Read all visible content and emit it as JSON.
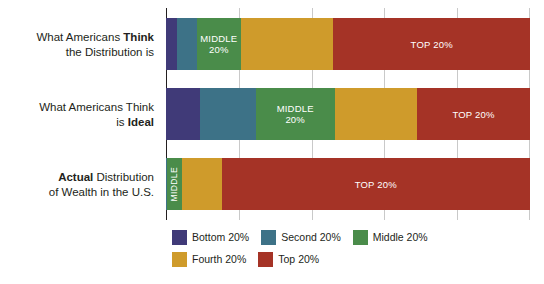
{
  "chart_data": {
    "type": "bar",
    "orientation": "horizontal",
    "stacked": true,
    "percent": true,
    "title": "",
    "subtitle": "",
    "xlabel": "",
    "ylabel": "",
    "xlim": [
      0,
      100
    ],
    "grid": true,
    "gridline_positions": [
      0,
      20,
      40,
      60,
      80,
      100
    ],
    "legend_position": "bottom-left",
    "categories": [
      "What Americans Think the Distribution is",
      "What Americans Think is Ideal",
      "Actual Distribution of Wealth in the U.S."
    ],
    "series": [
      {
        "name": "Bottom 20%",
        "color": "#403a78",
        "values": [
          2.9,
          9.3,
          0.1
        ]
      },
      {
        "name": "Second 20%",
        "color": "#3d7287",
        "values": [
          5.6,
          15.3,
          0.2
        ]
      },
      {
        "name": "Middle 20%",
        "color": "#4a8c4a",
        "values": [
          12.0,
          21.8,
          4.0
        ]
      },
      {
        "name": "Fourth 20%",
        "color": "#cf9b2b",
        "values": [
          25.5,
          22.6,
          11.0
        ]
      },
      {
        "name": "Top 20%",
        "color": "#a53326",
        "values": [
          54.0,
          31.0,
          84.7
        ]
      }
    ],
    "annotations": [
      {
        "bar": 1,
        "segment": "Middle 20%",
        "text": "MIDDLE\n20%"
      },
      {
        "bar": 1,
        "segment": "Top 20%",
        "text": "TOP 20%"
      },
      {
        "bar": 2,
        "segment": "Middle 20%",
        "text": "MIDDLE\n20%"
      },
      {
        "bar": 2,
        "segment": "Top 20%",
        "text": "TOP 20%"
      },
      {
        "bar": 3,
        "segment": "Middle 20%",
        "text": "MIDDLE"
      },
      {
        "bar": 3,
        "segment": "Top 20%",
        "text": "TOP 20%"
      }
    ]
  },
  "labels": {
    "row1": {
      "line1_plain": "What Americans ",
      "line1_bold": "Think",
      "line2_plain": "the Distribution is",
      "line2_bold": ""
    },
    "row2": {
      "line1_plain": "What Americans Think",
      "line1_bold": "",
      "line2_plain": "is ",
      "line2_bold": "Ideal"
    },
    "row3": {
      "line1_plain": " Distribution",
      "line1_bold": "Actual",
      "line2_plain": "of Wealth in the U.S.",
      "line2_bold": ""
    }
  },
  "bar_labels": {
    "b1_middle": "MIDDLE\n20%",
    "b1_top": "TOP 20%",
    "b2_middle": "MIDDLE\n20%",
    "b2_top": "TOP 20%",
    "b3_middle": "MIDDLE",
    "b3_top": "TOP 20%"
  },
  "legend": {
    "items": [
      {
        "label": "Bottom 20%",
        "color": "#403a78"
      },
      {
        "label": "Second 20%",
        "color": "#3d7287"
      },
      {
        "label": "Middle 20%",
        "color": "#4a8c4a"
      },
      {
        "label": "Fourth 20%",
        "color": "#cf9b2b"
      },
      {
        "label": "Top 20%",
        "color": "#a53326"
      }
    ]
  }
}
